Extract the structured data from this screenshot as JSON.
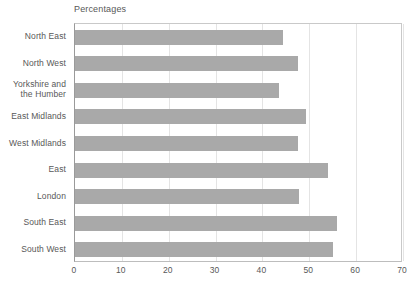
{
  "chart_data": {
    "type": "bar",
    "orientation": "horizontal",
    "title": "Percentages",
    "xlabel": "",
    "ylabel": "",
    "categories": [
      "North East",
      "North West",
      "Yorkshire and\nthe Humber",
      "East Midlands",
      "West Midlands",
      "East",
      "London",
      "South East",
      "South West"
    ],
    "values": [
      44.4,
      47.6,
      43.5,
      49.3,
      47.6,
      54.1,
      47.8,
      55.9,
      55.1
    ],
    "xlim": [
      0,
      70
    ],
    "xticks": [
      0,
      10,
      20,
      30,
      40,
      50,
      60,
      70
    ],
    "xtick_labels": [
      "0",
      "10",
      "20",
      "30",
      "40",
      "50",
      "60",
      "70"
    ],
    "grid": "vertical",
    "legend": "none",
    "bar_color": "#a9a9a9",
    "text_color": "#585858",
    "gridline_color": "#e4e4e4",
    "axis_color": "#9a9a9a",
    "background": "#ffffff"
  }
}
